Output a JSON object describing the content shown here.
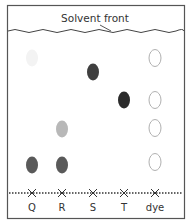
{
  "diagram": {
    "title": "Solvent front",
    "lanes": [
      {
        "label": "Q",
        "x": 32
      },
      {
        "label": "R",
        "x": 62
      },
      {
        "label": "S",
        "x": 93
      },
      {
        "label": "T",
        "x": 124
      },
      {
        "label": "dye",
        "x": 155
      }
    ],
    "spots": [
      {
        "lane": "Q",
        "cx": 32,
        "cy": 58,
        "fill": "#f3f3f3",
        "stroke": "none"
      },
      {
        "lane": "Q",
        "cx": 32,
        "cy": 165,
        "fill": "#5a5a5a",
        "stroke": "none"
      },
      {
        "lane": "R",
        "cx": 62,
        "cy": 129,
        "fill": "#b8b8b8",
        "stroke": "none"
      },
      {
        "lane": "R",
        "cx": 62,
        "cy": 165,
        "fill": "#5a5a5a",
        "stroke": "none"
      },
      {
        "lane": "S",
        "cx": 93,
        "cy": 72,
        "fill": "#3f3f3f",
        "stroke": "none"
      },
      {
        "lane": "T",
        "cx": 124,
        "cy": 100,
        "fill": "#2b2b2b",
        "stroke": "none"
      },
      {
        "lane": "dye",
        "cx": 155,
        "cy": 58,
        "fill": "#ffffff",
        "stroke": "#b0b0b0"
      },
      {
        "lane": "dye",
        "cx": 155,
        "cy": 100,
        "fill": "#ffffff",
        "stroke": "#b0b0b0"
      },
      {
        "lane": "dye",
        "cx": 155,
        "cy": 128,
        "fill": "#ffffff",
        "stroke": "#b0b0b0"
      },
      {
        "lane": "dye",
        "cx": 155,
        "cy": 162,
        "fill": "#ffffff",
        "stroke": "#b0b0b0"
      }
    ],
    "colors": {
      "border": "#555555",
      "line": "#444444"
    }
  }
}
